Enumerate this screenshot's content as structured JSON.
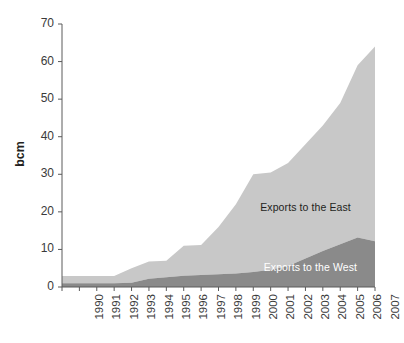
{
  "chart_data": {
    "type": "area",
    "stacked": true,
    "title": "",
    "subtitle": "",
    "xlabel": "",
    "ylabel": "bcm",
    "grid": false,
    "legend_position": "inline-annotations",
    "xlim": [
      1990,
      2008
    ],
    "ylim": [
      0,
      70
    ],
    "ytick_values": [
      0,
      10,
      20,
      30,
      40,
      50,
      60,
      70
    ],
    "ytick_labels": [
      "0",
      "10",
      "20",
      "30",
      "40",
      "50",
      "60",
      "70"
    ],
    "categories": [
      1990,
      1991,
      1992,
      1993,
      1994,
      1995,
      1996,
      1997,
      1998,
      1999,
      2000,
      2001,
      2002,
      2003,
      2004,
      2005,
      2006,
      2007,
      2008
    ],
    "xtick_labels": [
      "1990",
      "1991",
      "1992",
      "1993",
      "1994",
      "1995",
      "1996",
      "1997",
      "1998",
      "1999",
      "2000",
      "2001",
      "2002",
      "2003",
      "2004",
      "2005",
      "2006",
      "2007",
      "2008"
    ],
    "series": [
      {
        "name": "Exports to the West",
        "color": "#8a8a8a",
        "values": [
          1.0,
          1.0,
          1.0,
          1.0,
          1.1,
          2.2,
          2.6,
          3.0,
          3.2,
          3.4,
          3.6,
          4.0,
          4.6,
          5.6,
          7.6,
          9.6,
          11.4,
          13.2,
          12.2
        ]
      },
      {
        "name": "Exports to the East",
        "color": "#c8c8c8",
        "values": [
          1.9,
          1.9,
          1.9,
          1.9,
          3.9,
          4.6,
          4.4,
          8.0,
          8.0,
          12.6,
          18.4,
          26.0,
          25.9,
          27.4,
          30.4,
          33.4,
          37.6,
          45.8,
          51.8
        ]
      }
    ],
    "totals": [
      2.9,
      2.9,
      2.9,
      2.9,
      5.0,
      6.8,
      7.0,
      11.0,
      11.2,
      16.0,
      22.0,
      30.0,
      30.5,
      33.0,
      38.0,
      43.0,
      49.0,
      59.0,
      64.0
    ],
    "annotations": [
      {
        "text": "Exports to the East",
        "x": 2001.4,
        "y": 21.0
      },
      {
        "text": "Exports to the West",
        "x": 2001.6,
        "y": 5.0
      }
    ]
  },
  "axis": {
    "y_title": "bcm"
  }
}
